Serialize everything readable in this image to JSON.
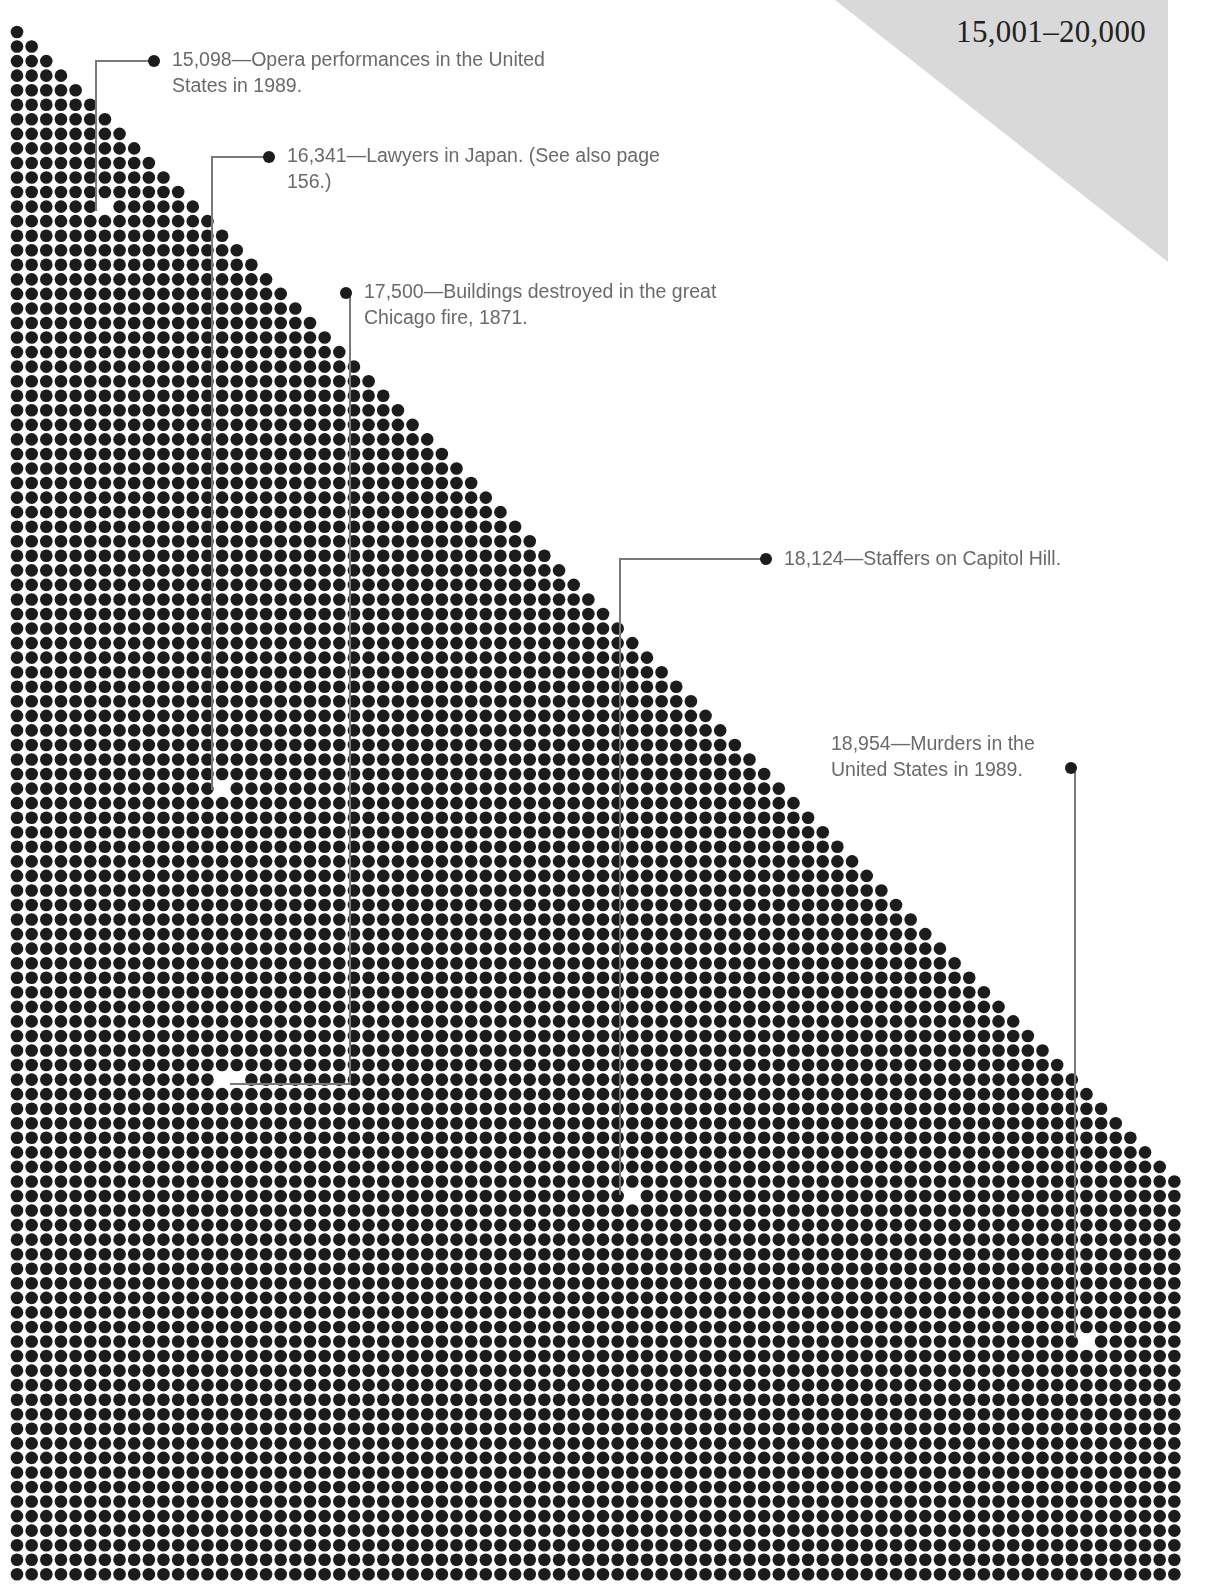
{
  "header": {
    "range_title": "15,001–20,000"
  },
  "colors": {
    "dot": "#1c1c1c",
    "corner_triangle": "#d9d9d9",
    "leader_line": "#7a7a7a",
    "callout_text": "#6a6a6a"
  },
  "grid": {
    "origin_x": 17,
    "origin_y": 32,
    "pitch_x": 14.65,
    "pitch_y": 14.55,
    "rows": 107,
    "cols": 80,
    "dot_radius": 6.3,
    "diagonal_rule": "row r (0-based) holds min(r+1, cols) dots"
  },
  "callouts": [
    {
      "value": "15,098",
      "text": "15,098—Opera performances in the United States in 1989.",
      "line1": "15,098—Opera performances in the United",
      "line2": "States in 1989.",
      "label_x": 172,
      "label_y": 46,
      "bullet_x": 154,
      "bullet_y": 61,
      "elbow_x": 96,
      "gap_x": 101,
      "gap_y": 211
    },
    {
      "value": "16,341",
      "text": "16,341—Lawyers in Japan. (See also page 156.)",
      "line1": "16,341—Lawyers in Japan. (See also page",
      "line2": "156.)",
      "label_x": 287,
      "label_y": 142,
      "bullet_x": 269,
      "bullet_y": 157,
      "elbow_x": 212,
      "gap_x": 226,
      "gap_y": 790
    },
    {
      "value": "17,500",
      "text": "17,500—Buildings destroyed in the great Chicago fire, 1871.",
      "line1": "17,500—Buildings destroyed in the great",
      "line2": "Chicago fire, 1871.",
      "label_x": 364,
      "label_y": 278,
      "bullet_x": 346,
      "bullet_y": 293,
      "elbow_x": 350,
      "gap_x": 230,
      "gap_y": 1078
    },
    {
      "value": "18,124",
      "text": "18,124—Staffers on Capitol Hill.",
      "line1": "18,124—Staffers on Capitol Hill.",
      "line2": "",
      "label_x": 784,
      "label_y": 545,
      "bullet_x": 766,
      "bullet_y": 559,
      "elbow_x": 620,
      "gap_x": 632,
      "gap_y": 1195
    },
    {
      "value": "18,954",
      "text": "18,954—Murders in the United States in 1989.",
      "line1": "18,954—Murders in the",
      "line2": "United States in 1989.",
      "label_x": 831,
      "label_y": 730,
      "bullet_x": 1071,
      "bullet_y": 768,
      "elbow_x": 1071,
      "gap_x": 1085,
      "gap_y": 1344
    }
  ],
  "chart_data": {
    "type": "pictogram-dot-grid",
    "title": "15,001–20,000",
    "xlabel": "",
    "ylabel": "",
    "range": [
      15001,
      20000
    ],
    "annotations": [
      {
        "value": 15098,
        "label": "Opera performances in the United States in 1989."
      },
      {
        "value": 16341,
        "label": "Lawyers in Japan. (See also page 156.)"
      },
      {
        "value": 17500,
        "label": "Buildings destroyed in the great Chicago fire, 1871."
      },
      {
        "value": 18124,
        "label": "Staffers on Capitol Hill."
      },
      {
        "value": 18954,
        "label": "Murders in the United States in 1989."
      }
    ],
    "grid": false,
    "legend": "none"
  }
}
